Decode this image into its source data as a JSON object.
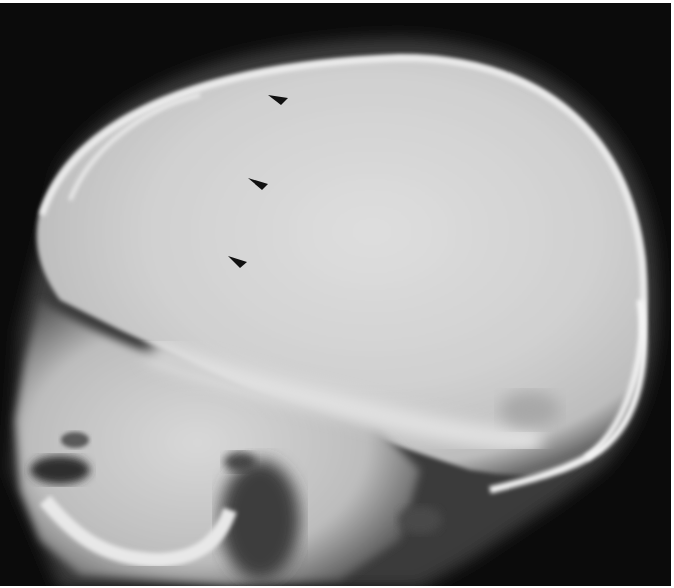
{
  "image": {
    "type": "lateral skull radiograph",
    "background_color": "#0b0b0b",
    "bone_color": "#e6e6e6",
    "vault_color": "#d2d2d2",
    "border_color": "#ffffff"
  },
  "annotations": {
    "arrowheads": [
      {
        "label": "arrowhead-1",
        "points": "268,95 288,98 281,105",
        "color": "#111111"
      },
      {
        "label": "arrowhead-2",
        "points": "248,178 268,184 262,190",
        "color": "#111111"
      },
      {
        "label": "arrowhead-3",
        "points": "228,256 247,262 240,268",
        "color": "#111111"
      }
    ]
  }
}
